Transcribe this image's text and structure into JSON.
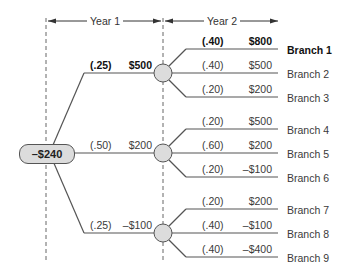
{
  "header": {
    "year1_label": "Year 1",
    "year2_label": "Year 2"
  },
  "root": {
    "value": "–$240"
  },
  "year1_nodes": [
    {
      "prob": "(.25)",
      "value": "$500",
      "bold": true
    },
    {
      "prob": "(.50)",
      "value": "$200",
      "bold": false
    },
    {
      "prob": "(.25)",
      "value": "–$100",
      "bold": false
    }
  ],
  "branches": [
    {
      "prob": "(.40)",
      "value": "$800",
      "label": "Branch 1",
      "bold": true
    },
    {
      "prob": "(.40)",
      "value": "$500",
      "label": "Branch 2",
      "bold": false
    },
    {
      "prob": "(.20)",
      "value": "$200",
      "label": "Branch 3",
      "bold": false
    },
    {
      "prob": "(.20)",
      "value": "$500",
      "label": "Branch 4",
      "bold": false
    },
    {
      "prob": "(.60)",
      "value": "$200",
      "label": "Branch 5",
      "bold": false
    },
    {
      "prob": "(.20)",
      "value": "–$100",
      "label": "Branch 6",
      "bold": false
    },
    {
      "prob": "(.20)",
      "value": "$200",
      "label": "Branch 7",
      "bold": false
    },
    {
      "prob": "(.40)",
      "value": "–$100",
      "label": "Branch 8",
      "bold": false
    },
    {
      "prob": "(.40)",
      "value": "–$400",
      "label": "Branch 9",
      "bold": false
    }
  ],
  "colors": {
    "line": "#555555",
    "node_fill": "#dcdcdc",
    "dash": "#666666"
  }
}
